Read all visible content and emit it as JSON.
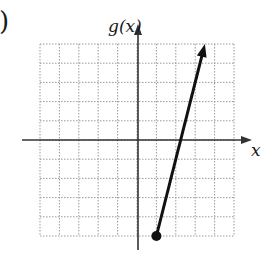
{
  "part_label": ")",
  "chart_data": {
    "type": "line",
    "title": "",
    "xlabel": "x",
    "ylabel": "g(x)",
    "xlim": [
      -5,
      5
    ],
    "ylim": [
      -5,
      5
    ],
    "grid": true,
    "grid_step": 1,
    "tick_labels": false,
    "series": [
      {
        "name": "g(x)",
        "points": [
          [
            1,
            -5
          ],
          [
            3.5,
            5
          ]
        ],
        "start": {
          "x": 1,
          "y": -5,
          "marker": "closed-dot"
        },
        "end": {
          "x": 3.5,
          "y": 5,
          "marker": "arrow"
        }
      }
    ]
  },
  "colors": {
    "grid": "#9a9a9a",
    "axis": "#333333",
    "line": "#111111"
  }
}
